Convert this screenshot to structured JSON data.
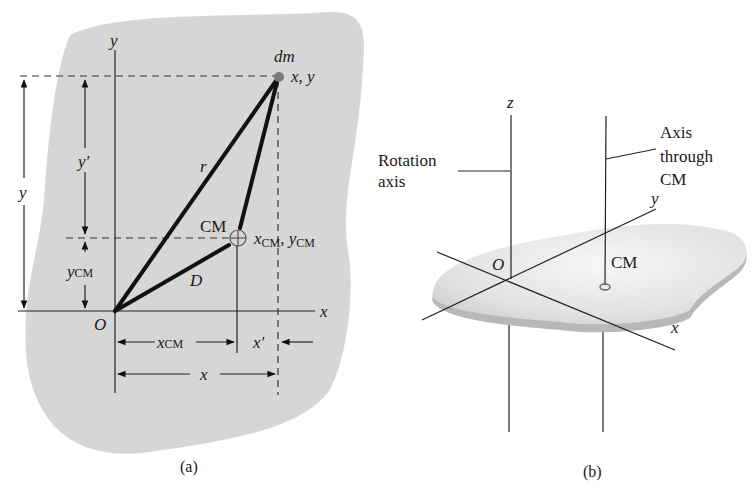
{
  "figure_a": {
    "caption": "(a)",
    "axis_y": "y",
    "axis_x": "x",
    "origin": "O",
    "point_label_dm": "dm",
    "point_coords": "x, y",
    "segment_r": "r",
    "segment_D": "D",
    "cm_label": "CM",
    "cm_coords_x": "x",
    "cm_coords_x_sub": "CM",
    "cm_coords_sep": ", ",
    "cm_coords_y": "y",
    "cm_coords_y_sub": "CM",
    "dim_y": "y",
    "dim_y_prime": "y′",
    "dim_ycm": "y",
    "dim_ycm_sub": "CM",
    "dim_xcm": "x",
    "dim_xcm_sub": "CM",
    "dim_x_prime": "x′",
    "dim_x": "x",
    "colors": {
      "body_fill": "#d6d6d6",
      "dm_dot": "#7a7a7a",
      "lines": "#111111"
    }
  },
  "figure_b": {
    "caption": "(b)",
    "axis_z": "z",
    "axis_y": "y",
    "axis_x": "x",
    "origin": "O",
    "cm_label": "CM",
    "rotation_axis_label_line1": "Rotation",
    "rotation_axis_label_line2": "axis",
    "cm_axis_label_line1": "Axis",
    "cm_axis_label_line2": "through",
    "cm_axis_label_line3": "CM",
    "colors": {
      "slab_top": "#e6e6e6",
      "slab_edge": "#b8b8b8"
    }
  }
}
